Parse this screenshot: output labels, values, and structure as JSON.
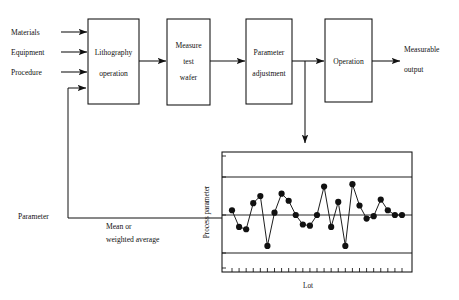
{
  "figure": {
    "type": "process-flow-with-control-chart",
    "background_color": "#ffffff",
    "ink_color": "#111111"
  },
  "flow": {
    "inputs": [
      {
        "label": "Materials",
        "arrow_y": 32
      },
      {
        "label": "Equipment",
        "arrow_y": 52
      },
      {
        "label": "Procedure",
        "arrow_y": 72
      }
    ],
    "boxes": [
      {
        "id": "lithography",
        "line1": "Lithography",
        "line2": "operation",
        "x": 88,
        "y": 19,
        "w": 51,
        "h": 85
      },
      {
        "id": "measure",
        "line1": "Measure",
        "line2": "test",
        "line3": "wafer",
        "x": 167,
        "y": 19,
        "w": 43,
        "h": 86
      },
      {
        "id": "parameter-adjustment",
        "line1": "Parameter",
        "line2": "adjustment",
        "x": 246,
        "y": 19,
        "w": 46,
        "h": 85
      },
      {
        "id": "operation",
        "line1": "Operation",
        "x": 325,
        "y": 19,
        "w": 47,
        "h": 83
      }
    ],
    "output": {
      "line1": "Measurable",
      "line2": "output"
    },
    "feedback": {
      "label": "Parameter",
      "note_line1": "Mean or",
      "note_line2": "weighted  average"
    }
  },
  "chart_data": {
    "type": "line",
    "title": "",
    "xlabel": "Lot",
    "ylabel": "Process parameter",
    "grid": false,
    "legend": false,
    "ylim": [
      0,
      100
    ],
    "xlim": [
      0,
      26
    ],
    "center_line": 50,
    "upper_control_limit": 82,
    "lower_control_limit": 18,
    "x_tick_count": 25,
    "x": [
      1,
      2,
      3,
      4,
      5,
      6,
      7,
      8,
      9,
      10,
      11,
      12,
      13,
      14,
      15,
      16,
      17,
      18,
      19,
      20,
      21,
      22,
      23,
      24,
      25
    ],
    "values": [
      54,
      40,
      38,
      60,
      66,
      24,
      52,
      68,
      62,
      50,
      42,
      41,
      50,
      74,
      40,
      61,
      24,
      76,
      58,
      47,
      49,
      63,
      54,
      50,
      50
    ],
    "series": [
      {
        "name": "Process parameter",
        "values": [
          54,
          40,
          38,
          60,
          66,
          24,
          52,
          68,
          62,
          50,
          42,
          41,
          50,
          74,
          40,
          61,
          24,
          76,
          58,
          47,
          49,
          63,
          54,
          50,
          50
        ]
      }
    ]
  }
}
